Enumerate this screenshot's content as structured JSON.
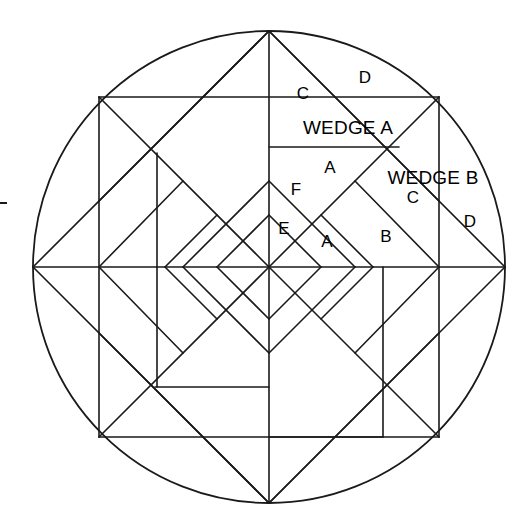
{
  "canvas": {
    "width": 521,
    "height": 530,
    "background": "#ffffff",
    "stroke_color": "#1a1a1a"
  },
  "figure": {
    "type": "geometric-line-diagram",
    "circle": {
      "cx": 269,
      "cy": 267,
      "r": 236
    },
    "symmetry": "4-fold rotational (90 degrees)",
    "inner_square_diamond": [
      [
        33,
        267
      ],
      [
        269,
        31
      ],
      [
        505,
        267
      ],
      [
        269,
        503
      ]
    ],
    "inner_square_axis": [
      [
        99,
        97
      ],
      [
        439,
        97
      ],
      [
        439,
        437
      ],
      [
        99,
        437
      ]
    ]
  },
  "labels": {
    "wedge_a": {
      "text": "WEDGE A",
      "x": 348,
      "y": 127
    },
    "wedge_b": {
      "text": "WEDGE B",
      "x": 433,
      "y": 177
    },
    "pieces": [
      {
        "id": "a-top-c",
        "text": "C",
        "x": 303,
        "y": 93
      },
      {
        "id": "a-top-d",
        "text": "D",
        "x": 365,
        "y": 77
      },
      {
        "id": "a-inner-a",
        "text": "A",
        "x": 330,
        "y": 167
      },
      {
        "id": "a-inner-f",
        "text": "F",
        "x": 296,
        "y": 189
      },
      {
        "id": "a-inner-e",
        "text": "E",
        "x": 284,
        "y": 228
      },
      {
        "id": "a-lower-a",
        "text": "A",
        "x": 327,
        "y": 241
      },
      {
        "id": "b-inner-b",
        "text": "B",
        "x": 386,
        "y": 236
      },
      {
        "id": "b-inner-c",
        "text": "C",
        "x": 413,
        "y": 197
      },
      {
        "id": "b-outer-d",
        "text": "D",
        "x": 470,
        "y": 221
      }
    ]
  },
  "margin_tick": {
    "x": 0,
    "y": 202,
    "w": 7,
    "h": 2
  }
}
